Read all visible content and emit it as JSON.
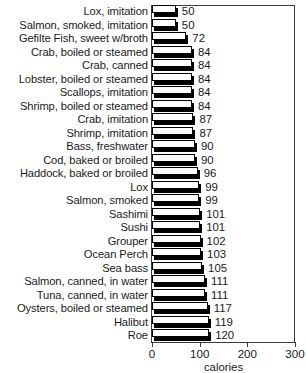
{
  "chart_data": {
    "type": "bar",
    "orientation": "horizontal",
    "title": "",
    "xlabel": "calories",
    "ylabel": "",
    "xlim": [
      0,
      300
    ],
    "xticks": [
      0,
      100,
      200,
      300
    ],
    "xtick_labels": [
      "0",
      "100",
      "200",
      "300"
    ],
    "grid": false,
    "legend": false,
    "value_labels": true,
    "categories": [
      "Lox,  imitation",
      "Salmon, smoked,  imitation",
      "Gefilte Fish, sweet w/broth",
      "Crab, boiled or steamed",
      "Crab, canned",
      "Lobster,  boiled or steamed",
      "Scallops, imitation",
      "Shrimp, boiled or steamed",
      "Crab, imitation",
      "Shrimp, imitation",
      "Bass, freshwater",
      "Cod, baked or broiled",
      "Haddock, baked or broiled",
      "Lox",
      "Salmon, smoked",
      "Sashimi",
      "Sushi",
      "Grouper",
      "Ocean Perch",
      "Sea bass",
      "Salmon, canned, in water",
      "Tuna, canned, in water",
      "Oysters, boiled or steamed",
      "Halibut",
      "Roe"
    ],
    "values": [
      50,
      50,
      72,
      84,
      84,
      84,
      84,
      84,
      87,
      87,
      90,
      90,
      96,
      99,
      99,
      101,
      101,
      102,
      103,
      105,
      111,
      111,
      117,
      119,
      120
    ],
    "value_label_texts": [
      "50",
      "50",
      "72",
      "84",
      "84",
      "84",
      "84",
      "84",
      "87",
      "87",
      "90",
      "90",
      "96",
      "99",
      "99",
      "101",
      "101",
      "102",
      "103",
      "105",
      "111",
      "111",
      "117",
      "119",
      "120"
    ],
    "colors": {
      "bar_face": "#ffffff",
      "bar_outline": "#000000",
      "bar_shadow": "#000000",
      "frame": "#3a3a3a",
      "text": "#1a1a1a",
      "background": "#ffffff"
    }
  }
}
